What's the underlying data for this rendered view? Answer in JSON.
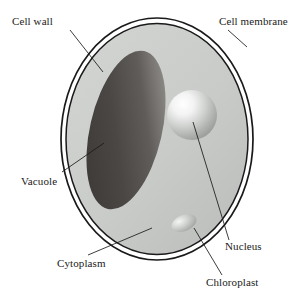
{
  "figure": {
    "type": "biological-diagram",
    "background_color": "#ffffff",
    "line_color": "#1a1a1a",
    "text_color": "#1a1a1a"
  },
  "labels": {
    "cell_wall": "Cell wall",
    "cell_membrane": "Cell membrane",
    "vacuole": "Vacuole",
    "cytoplasm": "Cytoplasm",
    "nucleus": "Nucleus",
    "chloroplast": "Chloroplast"
  },
  "structures": [
    {
      "name": "cell-wall",
      "shape": "ellipse-outline",
      "fill_color": "#ffffff",
      "stroke_color": "#1a1a1a"
    },
    {
      "name": "cell-membrane",
      "shape": "ellipse-outline",
      "fill_color": "#c9cbc9",
      "stroke_color": "#1a1a1a"
    },
    {
      "name": "cytoplasm",
      "shape": "ellipse-fill",
      "fill_color": "#c9cbc9"
    },
    {
      "name": "vacuole",
      "shape": "tilted-oval",
      "fill_color": "#4a4745",
      "highlight_color": "#8c8a87"
    },
    {
      "name": "nucleus",
      "shape": "sphere",
      "fill_color": "#b4b6b4",
      "highlight_color": "#ffffff"
    },
    {
      "name": "chloroplast",
      "shape": "small-tilted-oval",
      "fill_color": "#b0b2b0",
      "highlight_color": "#eeeeee"
    }
  ],
  "leader_lines": [
    {
      "name": "cell-wall-leader",
      "from": [
        70,
        30
      ],
      "to": [
        103,
        72
      ]
    },
    {
      "name": "cell-membrane-leader",
      "from": [
        228,
        30
      ],
      "to": [
        247,
        47
      ]
    },
    {
      "name": "vacuole-leader",
      "from": [
        62,
        172
      ],
      "to": [
        104,
        143
      ]
    },
    {
      "name": "cytoplasm-leader",
      "from": [
        88,
        255
      ],
      "to": [
        152,
        228
      ]
    },
    {
      "name": "nucleus-leader",
      "from": [
        229,
        240
      ],
      "to": [
        193,
        122
      ]
    },
    {
      "name": "chloroplast-leader",
      "from": [
        222,
        275
      ],
      "to": [
        194,
        228
      ]
    }
  ]
}
